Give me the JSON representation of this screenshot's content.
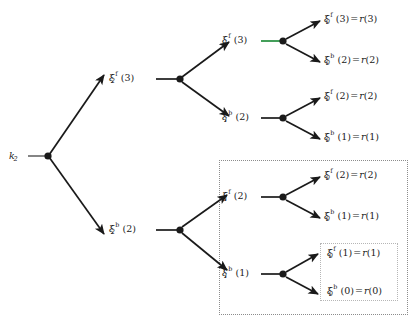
{
  "diagram": {
    "type": "tree",
    "background_color": "#ffffff",
    "edge_color": "#1a1a1a",
    "node_color": "#1a1a1a",
    "highlight_edge_color": "#3a9a52",
    "box_border_color": "#8c8c8c",
    "inner_box_border_color": "#b6b6b6"
  },
  "root": {
    "symbol": "k",
    "sub": "2",
    "name": "root-node-k2"
  },
  "level1": [
    {
      "symbol": "ξ",
      "sub": "2",
      "sup": "f",
      "arg": "(3)",
      "name": "node-xi2-f-3"
    },
    {
      "symbol": "ξ",
      "sub": "2",
      "sup": "b",
      "arg": "(2)",
      "name": "node-xi2-b-2"
    }
  ],
  "level2": [
    {
      "symbol": "ξ",
      "sub": "1",
      "sup": "f",
      "arg": "(3)",
      "name": "node-xi1-f-3",
      "stub_highlighted": true
    },
    {
      "symbol": "ξ",
      "sub": "1",
      "sup": "b",
      "arg": "(2)",
      "name": "node-xi1-b-2",
      "stub_highlighted": false
    },
    {
      "symbol": "ξ",
      "sub": "1",
      "sup": "f",
      "arg": "(2)",
      "name": "node-xi1-f-2",
      "stub_highlighted": false
    },
    {
      "symbol": "ξ",
      "sub": "1",
      "sup": "b",
      "arg": "(1)",
      "name": "node-xi1-b-1",
      "stub_highlighted": false
    }
  ],
  "leaves": [
    {
      "symbol": "ξ",
      "sub": "0",
      "sup": "f",
      "arg": "(3)",
      "eq": "=",
      "value": "r",
      "value_arg": "(3)",
      "name": "leaf-xi0-f-3"
    },
    {
      "symbol": "ξ",
      "sub": "0",
      "sup": "b",
      "arg": "(2)",
      "eq": "=",
      "value": "r",
      "value_arg": "(2)",
      "name": "leaf-xi0-b-2"
    },
    {
      "symbol": "ξ",
      "sub": "0",
      "sup": "f",
      "arg": "(2)",
      "eq": "=",
      "value": "r",
      "value_arg": "(2)",
      "name": "leaf-xi0-f-2-upper"
    },
    {
      "symbol": "ξ",
      "sub": "0",
      "sup": "b",
      "arg": "(1)",
      "eq": "=",
      "value": "r",
      "value_arg": "(1)",
      "name": "leaf-xi0-b-1-upper"
    },
    {
      "symbol": "ξ",
      "sub": "0",
      "sup": "f",
      "arg": "(2)",
      "eq": "=",
      "value": "r",
      "value_arg": "(2)",
      "name": "leaf-xi0-f-2-lower"
    },
    {
      "symbol": "ξ",
      "sub": "0",
      "sup": "b",
      "arg": "(1)",
      "eq": "=",
      "value": "r",
      "value_arg": "(1)",
      "name": "leaf-xi0-b-1-lower"
    },
    {
      "symbol": "ξ",
      "sub": "0",
      "sup": "f",
      "arg": "(1)",
      "eq": "=",
      "value": "r",
      "value_arg": "(1)",
      "name": "leaf-xi0-f-1-boxed"
    },
    {
      "symbol": "ξ",
      "sub": "0",
      "sup": "b",
      "arg": "(0)",
      "eq": "=",
      "value": "r",
      "value_arg": "(0)",
      "name": "leaf-xi0-b-0-boxed"
    }
  ]
}
